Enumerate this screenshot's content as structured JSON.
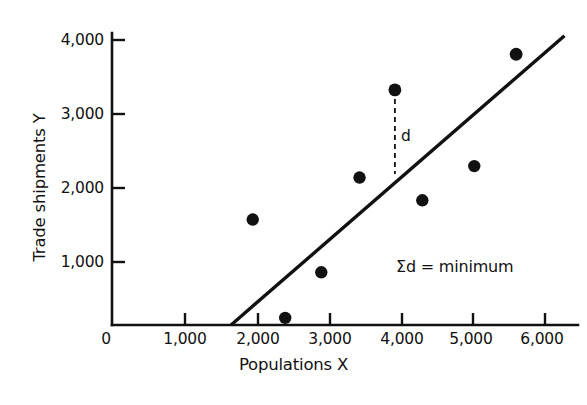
{
  "chart_data": {
    "type": "scatter",
    "title": "",
    "xlabel": "Populations X",
    "ylabel": "Trade shipments Y",
    "xlim": [
      0,
      6450
    ],
    "ylim": [
      0,
      4200
    ],
    "grid": false,
    "legend": "none",
    "x_ticks": [
      0,
      1000,
      2000,
      3000,
      4000,
      5000,
      6000
    ],
    "x_tick_labels": [
      "0",
      "1,000",
      "2,000",
      "3,000",
      "4,000",
      "5,000",
      "6,000"
    ],
    "y_ticks": [
      1000,
      2000,
      3000,
      4000
    ],
    "y_tick_labels": [
      "1,000",
      "2,000",
      "3,000",
      "4,000"
    ],
    "origin_label": "0",
    "points": [
      {
        "x": 1950,
        "y": 1480
      },
      {
        "x": 2400,
        "y": 100
      },
      {
        "x": 2900,
        "y": 740
      },
      {
        "x": 3430,
        "y": 2070
      },
      {
        "x": 3920,
        "y": 3300
      },
      {
        "x": 4300,
        "y": 1750
      },
      {
        "x": 5020,
        "y": 2230
      },
      {
        "x": 5600,
        "y": 3800
      }
    ],
    "series": [
      {
        "name": "observations",
        "marker": "filled-circle",
        "color": "#111111",
        "x": [
          1950,
          2400,
          2900,
          3430,
          3920,
          4300,
          5020,
          5600
        ],
        "values": [
          1480,
          100,
          740,
          2070,
          3300,
          1750,
          2230,
          3800
        ]
      }
    ],
    "fit_line": {
      "name": "least-squares regression line",
      "color": "#111111",
      "x_start": 1650,
      "y_start": 0,
      "x_end": 6270,
      "y_end": 4060
    },
    "residual": {
      "label": "d",
      "style": "dashed",
      "x": 3920,
      "y_top": 3300,
      "y_bottom": 2120
    },
    "annotations": [
      {
        "name": "sum-d-annotation",
        "text": "Σd = minimum",
        "x": 4600,
        "y": 900
      }
    ]
  },
  "axes": {
    "y_title": "Trade shipments Y",
    "x_title": "Populations X",
    "origin": "0"
  },
  "annotation": {
    "sum_d": "Σd = minimum",
    "residual_d": "d"
  }
}
